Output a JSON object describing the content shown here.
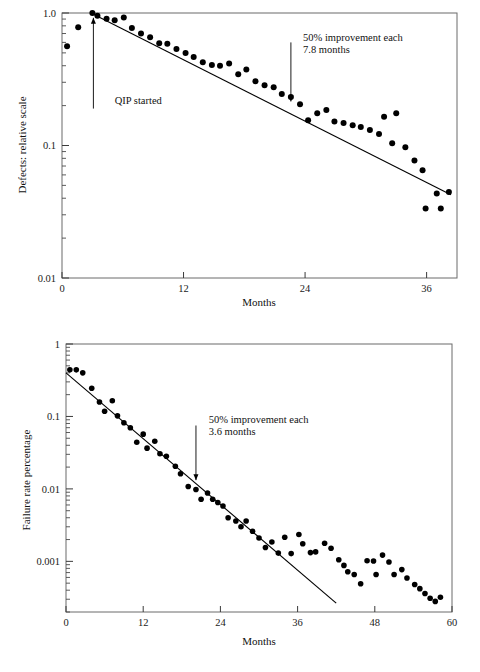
{
  "document": {
    "background_color": "#ffffff",
    "ink_color": "#000000",
    "frame_color": "#6b6b6b"
  },
  "chart_data": [
    {
      "id": "defects-chart",
      "type": "scatter",
      "title": "",
      "subtitle": "",
      "xlabel": "Months",
      "ylabel": "Defects: relative scale",
      "yscale": "log",
      "xscale": "linear",
      "xlim": [
        0,
        39
      ],
      "ylim": [
        0.01,
        1.0
      ],
      "xticks": [
        0,
        12,
        24,
        36
      ],
      "xticklabels": [
        "0",
        "12",
        "24",
        "36"
      ],
      "yticks": [
        1.0,
        0.1,
        0.01
      ],
      "yticklabels": [
        "1.0",
        "0.1",
        "0.01"
      ],
      "grid": false,
      "legend": null,
      "annotations": [
        {
          "name": "qip-started",
          "text_lines": [
            "QIP started"
          ],
          "text_x": 5.2,
          "text_y": 0.205,
          "arrow_from_x": 3.1,
          "arrow_from_y": 0.19,
          "arrow_to_x": 3.1,
          "arrow_to_y": 0.92,
          "arrow_direction": "up"
        },
        {
          "name": "improvement-rate",
          "text_lines": [
            "50% improvement each",
            "7.8 months"
          ],
          "text_x": 23.8,
          "text_y": 0.62,
          "arrow_from_x": 22.6,
          "arrow_from_y": 0.6,
          "arrow_to_x": 22.6,
          "arrow_to_y": 0.215,
          "arrow_direction": "down"
        }
      ],
      "fit_line": {
        "name": "trend-line",
        "x_start": 3.1,
        "y_start": 0.98,
        "x_end": 38.4,
        "y_end": 0.0425,
        "halving_months": 7.8
      },
      "series": [
        {
          "name": "defects",
          "marker": "filled-circle",
          "color": "#000000",
          "points": [
            [
              0.5,
              0.56
            ],
            [
              1.6,
              0.78
            ],
            [
              3.0,
              1.0
            ],
            [
              3.5,
              0.955
            ],
            [
              4.4,
              0.905
            ],
            [
              5.2,
              0.88
            ],
            [
              6.1,
              0.925
            ],
            [
              6.9,
              0.77
            ],
            [
              7.8,
              0.7
            ],
            [
              8.7,
              0.655
            ],
            [
              9.6,
              0.59
            ],
            [
              10.4,
              0.585
            ],
            [
              11.3,
              0.535
            ],
            [
              12.2,
              0.5
            ],
            [
              13.0,
              0.465
            ],
            [
              13.9,
              0.425
            ],
            [
              14.8,
              0.405
            ],
            [
              15.6,
              0.4
            ],
            [
              16.5,
              0.415
            ],
            [
              17.4,
              0.345
            ],
            [
              18.2,
              0.375
            ],
            [
              19.1,
              0.305
            ],
            [
              20.0,
              0.285
            ],
            [
              20.9,
              0.275
            ],
            [
              21.7,
              0.245
            ],
            [
              22.6,
              0.232
            ],
            [
              23.5,
              0.205
            ],
            [
              24.3,
              0.155
            ],
            [
              25.2,
              0.175
            ],
            [
              26.1,
              0.185
            ],
            [
              26.9,
              0.152
            ],
            [
              27.8,
              0.148
            ],
            [
              28.7,
              0.142
            ],
            [
              29.5,
              0.138
            ],
            [
              30.4,
              0.131
            ],
            [
              31.3,
              0.122
            ],
            [
              31.8,
              0.165
            ],
            [
              33.0,
              0.175
            ],
            [
              32.6,
              0.104
            ],
            [
              33.9,
              0.097
            ],
            [
              34.8,
              0.077
            ],
            [
              35.6,
              0.065
            ],
            [
              35.9,
              0.0335
            ],
            [
              37.0,
              0.0435
            ],
            [
              37.4,
              0.0335
            ],
            [
              38.2,
              0.0445
            ]
          ]
        }
      ]
    },
    {
      "id": "failure-rate-chart",
      "type": "scatter",
      "title": "",
      "subtitle": "",
      "xlabel": "Months",
      "ylabel": "Failure rate percentage",
      "yscale": "log",
      "xscale": "linear",
      "xlim": [
        0,
        60
      ],
      "ylim": [
        0.0002,
        1.0
      ],
      "xticks": [
        0,
        12,
        24,
        36,
        48,
        60
      ],
      "xticklabels": [
        "0",
        "12",
        "24",
        "36",
        "48",
        "60"
      ],
      "yticks": [
        1,
        0.1,
        0.01,
        0.001
      ],
      "yticklabels": [
        "1",
        "0.1",
        "0.01",
        "0.001"
      ],
      "grid": false,
      "legend": null,
      "annotations": [
        {
          "name": "improvement-rate",
          "text_lines": [
            "50% improvement each",
            "3.6 months"
          ],
          "text_x": 22.2,
          "text_y": 0.08,
          "arrow_from_x": 20.2,
          "arrow_from_y": 0.075,
          "arrow_to_x": 20.2,
          "arrow_to_y": 0.0132,
          "arrow_direction": "down"
        }
      ],
      "fit_line": {
        "name": "trend-line",
        "x_start": 0.0,
        "y_start": 0.4,
        "x_end": 42.0,
        "y_end": 0.000265,
        "halving_months": 3.6
      },
      "series": [
        {
          "name": "failure-rate",
          "marker": "filled-circle",
          "color": "#000000",
          "points": [
            [
              0.6,
              0.44
            ],
            [
              1.6,
              0.44
            ],
            [
              2.6,
              0.4
            ],
            [
              4.0,
              0.245
            ],
            [
              5.2,
              0.158
            ],
            [
              6.0,
              0.118
            ],
            [
              7.2,
              0.165
            ],
            [
              8.0,
              0.102
            ],
            [
              9.0,
              0.082
            ],
            [
              10.0,
              0.07
            ],
            [
              11.0,
              0.044
            ],
            [
              12.0,
              0.057
            ],
            [
              12.6,
              0.0365
            ],
            [
              13.8,
              0.0455
            ],
            [
              14.6,
              0.0305
            ],
            [
              15.6,
              0.0282
            ],
            [
              17.0,
              0.0205
            ],
            [
              17.8,
              0.0162
            ],
            [
              19.0,
              0.0108
            ],
            [
              20.2,
              0.0098
            ],
            [
              21.0,
              0.0072
            ],
            [
              22.0,
              0.0088
            ],
            [
              22.8,
              0.0072
            ],
            [
              23.6,
              0.0065
            ],
            [
              24.4,
              0.0058
            ],
            [
              25.2,
              0.004
            ],
            [
              26.4,
              0.0036
            ],
            [
              27.2,
              0.003
            ],
            [
              28.0,
              0.0036
            ],
            [
              29.0,
              0.0026
            ],
            [
              30.0,
              0.0021
            ],
            [
              31.0,
              0.00155
            ],
            [
              32.0,
              0.00185
            ],
            [
              33.0,
              0.0013
            ],
            [
              34.0,
              0.00215
            ],
            [
              35.0,
              0.00128
            ],
            [
              36.2,
              0.00235
            ],
            [
              36.8,
              0.00175
            ],
            [
              38.0,
              0.00132
            ],
            [
              38.8,
              0.00135
            ],
            [
              40.2,
              0.00178
            ],
            [
              41.2,
              0.00152
            ],
            [
              42.4,
              0.00105
            ],
            [
              43.2,
              0.00088
            ],
            [
              43.8,
              0.00072
            ],
            [
              44.8,
              0.00066
            ],
            [
              45.8,
              0.00049
            ],
            [
              46.8,
              0.00102
            ],
            [
              47.8,
              0.00101
            ],
            [
              48.2,
              0.00066
            ],
            [
              49.2,
              0.00122
            ],
            [
              50.2,
              0.00098
            ],
            [
              51.0,
              0.00066
            ],
            [
              52.2,
              0.00077
            ],
            [
              53.0,
              0.00059
            ],
            [
              54.2,
              0.00048
            ],
            [
              55.0,
              0.00042
            ],
            [
              55.8,
              0.00036
            ],
            [
              56.6,
              0.00031
            ],
            [
              57.4,
              0.00028
            ],
            [
              58.2,
              0.00032
            ]
          ]
        }
      ]
    }
  ]
}
